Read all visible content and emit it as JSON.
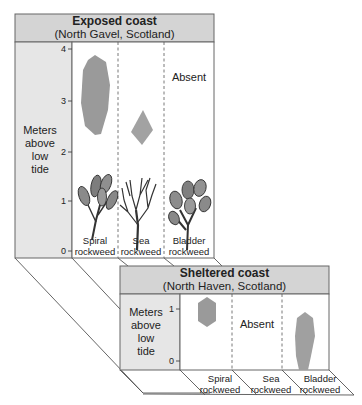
{
  "panels": {
    "exposed": {
      "title": "Exposed coast",
      "subtitle": "(North Gavel, Scotland)",
      "y_axis_label": [
        "Meters",
        "above",
        "low",
        "tide"
      ],
      "ticks": [
        "4",
        "3",
        "2",
        "1",
        "0"
      ],
      "columns": [
        {
          "name_line1": "Spiral",
          "name_line2": "rockweed",
          "range_m": [
            2.3,
            3.9
          ],
          "status": "present"
        },
        {
          "name_line1": "Sea",
          "name_line2": "rockweed",
          "range_m": [
            1.8,
            2.5
          ],
          "status": "present"
        },
        {
          "name_line1": "Bladder",
          "name_line2": "rockweed",
          "status": "Absent"
        }
      ]
    },
    "sheltered": {
      "title": "Sheltered coast",
      "subtitle": "(North Haven, Scotland)",
      "y_axis_label": [
        "Meters",
        "above",
        "low",
        "tide"
      ],
      "ticks": [
        "1",
        "0"
      ],
      "columns": [
        {
          "name_line1": "Spiral",
          "name_line2": "rockweed",
          "range_m": [
            0.8,
            1.2
          ],
          "status": "present"
        },
        {
          "name_line1": "Sea",
          "name_line2": "rockweed",
          "status": "Absent"
        },
        {
          "name_line1": "Bladder",
          "name_line2": "rockweed",
          "range_m": [
            0.0,
            0.9
          ],
          "status": "present"
        }
      ]
    }
  },
  "colors": {
    "header_fill": "#d4d4d4",
    "axis_fill": "#e4e4e4",
    "range_fill": "#9a9a9a",
    "line": "#555555"
  }
}
